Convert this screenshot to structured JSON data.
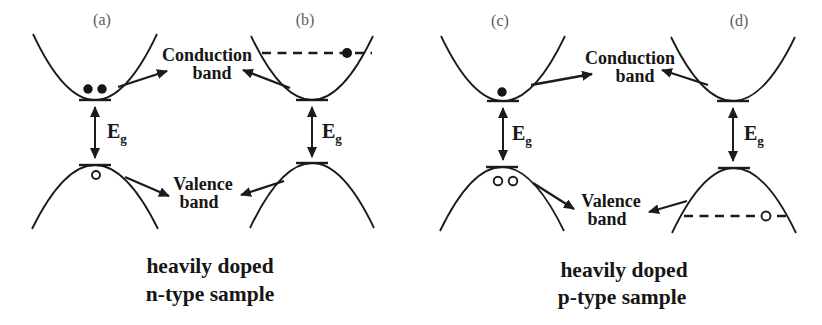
{
  "diagram": {
    "background_color": "#ffffff",
    "ink_color": "#1b1b1b",
    "panel_label_color": "#5c5c5c",
    "panel_labels": {
      "a": "(a)",
      "b": "(b)",
      "c": "(c)",
      "d": "(d)"
    },
    "band_labels": {
      "conduction_line1": "Conduction",
      "conduction_line2": "band",
      "valence_line1": "Valence",
      "valence_line2": "band"
    },
    "bandgap": {
      "symbol": "E",
      "subscript": "g"
    },
    "captions": {
      "n_type_line1": "heavily doped",
      "n_type_line2": "n-type sample",
      "p_type_line1": "heavily doped",
      "p_type_line2": "p-type sample"
    }
  }
}
